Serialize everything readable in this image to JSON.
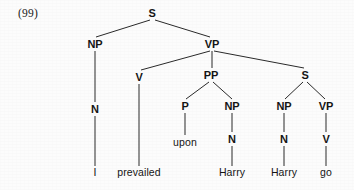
{
  "figure": {
    "example_number": "(99)",
    "caption": "",
    "type": "syntax-tree",
    "width": 354,
    "height": 190,
    "background_color": "#fcfcfc",
    "ink_color": "#151515",
    "edge_color": "#2a2a2a"
  },
  "sentence": "I prevailed upon Harry Harry go",
  "nodes": [
    {
      "id": "S0",
      "label": "S",
      "x": 152,
      "y": 13,
      "kind": "category"
    },
    {
      "id": "NP1",
      "label": "NP",
      "x": 95,
      "y": 44,
      "kind": "category"
    },
    {
      "id": "VP1",
      "label": "VP",
      "x": 212,
      "y": 44,
      "kind": "category"
    },
    {
      "id": "N1",
      "label": "N",
      "x": 95,
      "y": 109,
      "kind": "category"
    },
    {
      "id": "V1",
      "label": "V",
      "x": 139,
      "y": 77,
      "kind": "category"
    },
    {
      "id": "PP1",
      "label": "PP",
      "x": 211,
      "y": 75,
      "kind": "category"
    },
    {
      "id": "S1",
      "label": "S",
      "x": 305,
      "y": 75,
      "kind": "category"
    },
    {
      "id": "P1",
      "label": "P",
      "x": 185,
      "y": 106,
      "kind": "category"
    },
    {
      "id": "NP2",
      "label": "NP",
      "x": 232,
      "y": 106,
      "kind": "category"
    },
    {
      "id": "NP3",
      "label": "NP",
      "x": 284,
      "y": 106,
      "kind": "category"
    },
    {
      "id": "VP2",
      "label": "VP",
      "x": 326,
      "y": 106,
      "kind": "category"
    },
    {
      "id": "N2",
      "label": "N",
      "x": 232,
      "y": 139,
      "kind": "category"
    },
    {
      "id": "N3",
      "label": "N",
      "x": 284,
      "y": 139,
      "kind": "category"
    },
    {
      "id": "V2",
      "label": "V",
      "x": 326,
      "y": 139,
      "kind": "category"
    },
    {
      "id": "W_I",
      "label": "I",
      "x": 95,
      "y": 172,
      "kind": "word"
    },
    {
      "id": "W_PRE",
      "label": "prevailed",
      "x": 139,
      "y": 172,
      "kind": "word"
    },
    {
      "id": "W_UPO",
      "label": "upon",
      "x": 185,
      "y": 142,
      "kind": "word"
    },
    {
      "id": "W_HA1",
      "label": "Harry",
      "x": 232,
      "y": 172,
      "kind": "word"
    },
    {
      "id": "W_HA2",
      "label": "Harry",
      "x": 284,
      "y": 172,
      "kind": "word"
    },
    {
      "id": "W_GO",
      "label": "go",
      "x": 326,
      "y": 172,
      "kind": "word"
    }
  ],
  "edges": [
    {
      "from": "S0",
      "to": "NP1",
      "x1": 150,
      "y1": 20,
      "x2": 96,
      "y2": 37
    },
    {
      "from": "S0",
      "to": "VP1",
      "x1": 155,
      "y1": 20,
      "x2": 210,
      "y2": 37
    },
    {
      "from": "NP1",
      "to": "N1",
      "x1": 95,
      "y1": 51,
      "x2": 95,
      "y2": 102
    },
    {
      "from": "N1",
      "to": "W_I",
      "x1": 95,
      "y1": 116,
      "x2": 95,
      "y2": 166
    },
    {
      "from": "VP1",
      "to": "V1",
      "x1": 210,
      "y1": 51,
      "x2": 141,
      "y2": 70
    },
    {
      "from": "VP1",
      "to": "PP1",
      "x1": 212,
      "y1": 51,
      "x2": 212,
      "y2": 68
    },
    {
      "from": "VP1",
      "to": "S1",
      "x1": 214,
      "y1": 51,
      "x2": 304,
      "y2": 68
    },
    {
      "from": "V1",
      "to": "W_PRE",
      "x1": 139,
      "y1": 84,
      "x2": 139,
      "y2": 166
    },
    {
      "from": "PP1",
      "to": "P1",
      "x1": 209,
      "y1": 82,
      "x2": 186,
      "y2": 99
    },
    {
      "from": "PP1",
      "to": "NP2",
      "x1": 213,
      "y1": 82,
      "x2": 232,
      "y2": 99
    },
    {
      "from": "P1",
      "to": "W_UPO",
      "x1": 185,
      "y1": 113,
      "x2": 185,
      "y2": 135
    },
    {
      "from": "NP2",
      "to": "N2",
      "x1": 232,
      "y1": 113,
      "x2": 232,
      "y2": 132
    },
    {
      "from": "N2",
      "to": "W_HA1",
      "x1": 232,
      "y1": 146,
      "x2": 232,
      "y2": 166
    },
    {
      "from": "S1",
      "to": "NP3",
      "x1": 303,
      "y1": 82,
      "x2": 285,
      "y2": 99
    },
    {
      "from": "S1",
      "to": "VP2",
      "x1": 307,
      "y1": 82,
      "x2": 325,
      "y2": 99
    },
    {
      "from": "NP3",
      "to": "N3",
      "x1": 284,
      "y1": 113,
      "x2": 284,
      "y2": 132
    },
    {
      "from": "N3",
      "to": "W_HA2",
      "x1": 284,
      "y1": 146,
      "x2": 284,
      "y2": 166
    },
    {
      "from": "VP2",
      "to": "V2",
      "x1": 326,
      "y1": 113,
      "x2": 326,
      "y2": 132
    },
    {
      "from": "V2",
      "to": "W_GO",
      "x1": 326,
      "y1": 146,
      "x2": 326,
      "y2": 166
    }
  ]
}
